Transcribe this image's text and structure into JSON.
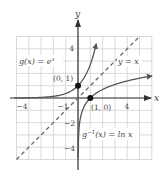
{
  "chart_data": {
    "type": "line",
    "title": "",
    "xlabel": "x",
    "ylabel": "y",
    "xlim": [
      -5,
      6
    ],
    "ylim": [
      -5,
      5
    ],
    "grid": true,
    "x_ticks": [
      {
        "value": -4,
        "label": "-4"
      },
      {
        "value": -1,
        "label": "-1"
      },
      {
        "value": 4,
        "label": "4"
      }
    ],
    "y_ticks": [
      {
        "value": 4,
        "label": "4"
      },
      {
        "value": -2,
        "label": "-2"
      },
      {
        "value": -4,
        "label": "-4"
      }
    ],
    "series": [
      {
        "name": "g(x) = e^x",
        "function": "exp",
        "style": "solid",
        "color": "#555555",
        "x": [
          -5,
          -4,
          -3,
          -2,
          -1,
          0,
          1,
          1.5
        ],
        "values": [
          0.007,
          0.018,
          0.05,
          0.135,
          0.368,
          1,
          2.718,
          4.48
        ]
      },
      {
        "name": "g^-1(x) = ln x",
        "function": "ln",
        "style": "solid",
        "color": "#555555",
        "x": [
          0.01,
          0.05,
          0.1,
          0.25,
          0.5,
          1,
          2,
          3,
          4,
          5,
          6
        ],
        "values": [
          -4.6,
          -3.0,
          -2.3,
          -1.39,
          -0.69,
          0,
          0.69,
          1.1,
          1.39,
          1.61,
          1.79
        ]
      },
      {
        "name": "y = x",
        "function": "identity",
        "style": "dashed",
        "color": "#666666",
        "x": [
          -5,
          5
        ],
        "values": [
          -5,
          5
        ]
      }
    ],
    "points": [
      {
        "label": "(0, 1)",
        "x": 0,
        "y": 1
      },
      {
        "label": "(1, 0)",
        "x": 1,
        "y": 0
      }
    ],
    "annotations": [
      {
        "text": "g(x) = e^x",
        "near": [
          -3.5,
          3
        ]
      },
      {
        "text": "y = x",
        "near": [
          4,
          2.5
        ]
      },
      {
        "text": "g^-1(x) = ln x",
        "near": [
          3,
          -2.5
        ]
      }
    ]
  },
  "labels": {
    "axis_x": "x",
    "axis_y": "y",
    "tick_x_neg4": "−4",
    "tick_x_neg1": "−1",
    "tick_x_4": "4",
    "tick_y_4": "4",
    "tick_y_neg2": "−2",
    "tick_y_neg4": "−4",
    "point_01": "(0, 1)",
    "point_10": "(1, 0)",
    "exp_label_main": "g(x) = e",
    "exp_label_sup": "x",
    "identity_label": "y = x",
    "ln_label_g": "g",
    "ln_label_sup": "−1",
    "ln_label_rest": "(x) = ln x"
  }
}
